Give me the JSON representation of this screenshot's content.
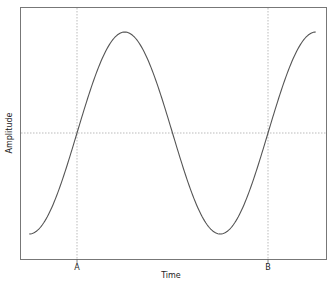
{
  "chart_data": {
    "type": "line",
    "title": "",
    "xlabel": "Time",
    "ylabel": "Amplitude",
    "x_ticks": [
      {
        "label": "A",
        "x": 0
      },
      {
        "label": "B",
        "x": 1
      }
    ],
    "y_ticks": [],
    "xlim": [
      -0.25,
      1.25
    ],
    "ylim": [
      -1.0,
      1.0
    ],
    "grid": {
      "vertical_at": [
        "A",
        "B"
      ],
      "horizontal_at": [
        0
      ],
      "style": "dotted"
    },
    "legend": null,
    "series": [
      {
        "name": "sine wave",
        "function": "sin(2*pi*t)",
        "x": [
          -0.25,
          -0.125,
          0,
          0.125,
          0.25,
          0.375,
          0.5,
          0.625,
          0.75,
          0.875,
          1.0,
          1.125,
          1.25
        ],
        "values": [
          -1.0,
          -0.707,
          0,
          0.707,
          1.0,
          0.707,
          0,
          -0.707,
          -1.0,
          -0.707,
          0,
          0.707,
          1.0
        ]
      }
    ],
    "colors": {
      "line": "#555555",
      "frame": "#666666",
      "grid": "#bbbbbb"
    }
  }
}
